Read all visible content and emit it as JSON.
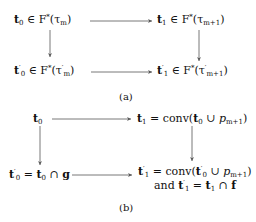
{
  "diagram_a": {
    "caption": "(a)",
    "nodes": {
      "top_left": {
        "sym": "t",
        "sub": "0",
        "prime": "",
        "rel": " ∈ F",
        "star": "*",
        "arg": "(τ",
        "arg_sub": "m",
        "arg_prime": "",
        "close": ")"
      },
      "top_right": {
        "sym": "t",
        "sub": "1",
        "prime": "",
        "rel": " ∈ F",
        "star": "*",
        "arg": "(τ",
        "arg_sub": "m+1",
        "arg_prime": "",
        "close": ")"
      },
      "bottom_left": {
        "sym": "t",
        "sub": "0",
        "prime": "′",
        "rel": " ∈ F",
        "star": "*",
        "arg": "(τ",
        "arg_sub": "m",
        "arg_prime": "′",
        "close": ")"
      },
      "bottom_right": {
        "sym": "t",
        "sub": "1",
        "prime": "′",
        "rel": " ∈ F",
        "star": "*",
        "arg": "(τ",
        "arg_sub": "m+1",
        "arg_prime": "′",
        "close": ")"
      }
    },
    "arrows": [
      "top_left→top_right",
      "top_left→bottom_left",
      "top_right→bottom_right",
      "bottom_left→bottom_right"
    ]
  },
  "diagram_b": {
    "caption": "(b)",
    "nodes": {
      "top_left": "t₀",
      "top_right": "t₁ = conv(t₀ ∪ p_{m+1})",
      "bottom_left": "t′₀ = t₀ ∩ g",
      "bottom_right_line1": "t′₁ = conv(t′₀ ∪ p_{m+1})",
      "bottom_right_line2": "and t′₁ = t₁ ∩ f"
    },
    "labels": {
      "t": "t",
      "eq": " = ",
      "conv": "conv(",
      "cup": " ∪ ",
      "cap": " ∩ ",
      "p": "p",
      "msub": "m+1",
      "g": "g",
      "f": "f",
      "and": "and ",
      "close": ")",
      "prime": "′",
      "zero": "0",
      "one": "1"
    },
    "arrows": [
      "top_left→top_right",
      "top_left→bottom_left",
      "top_right→bottom_right",
      "bottom_left→bottom_right"
    ]
  }
}
